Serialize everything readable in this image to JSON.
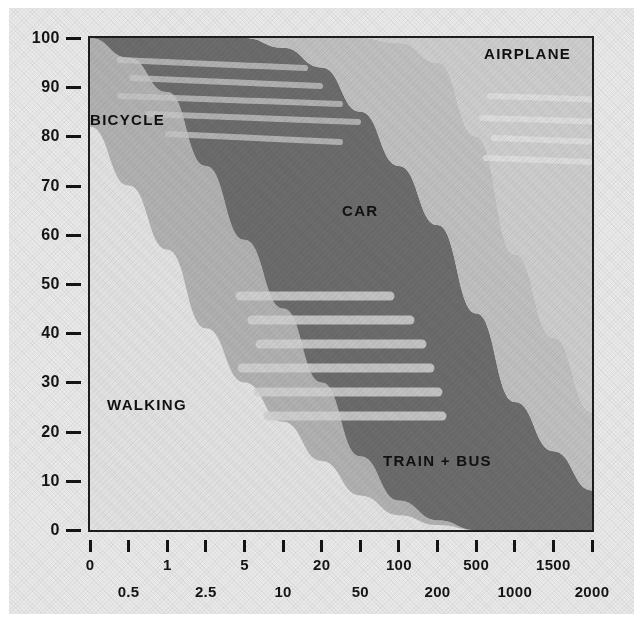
{
  "chart_data": {
    "type": "area",
    "title": "",
    "subtitle": "",
    "xlabel": "",
    "ylabel": "",
    "grid": false,
    "legend_position": "inline-labels",
    "ylim": [
      0,
      100
    ],
    "ytick_labels": [
      "100",
      "90",
      "80",
      "70",
      "60",
      "50",
      "40",
      "30",
      "20",
      "10",
      "0"
    ],
    "ytick_values": [
      100,
      90,
      80,
      70,
      60,
      50,
      40,
      30,
      20,
      10,
      0
    ],
    "xtick_labels_upper": [
      "0",
      "1",
      "5",
      "20",
      "100",
      "500",
      "1500"
    ],
    "xtick_labels_lower": [
      "0.5",
      "2.5",
      "10",
      "50",
      "200",
      "1000",
      "2000"
    ],
    "xtick_labels_interleaved": [
      "0",
      "0.5",
      "1",
      "2.5",
      "5",
      "10",
      "20",
      "50",
      "100",
      "200",
      "500",
      "1000",
      "1500",
      "2000"
    ],
    "xtick_count": 14,
    "x": [
      0,
      0.5,
      1,
      2.5,
      5,
      10,
      20,
      50,
      100,
      200,
      500,
      1000,
      1500,
      2000
    ],
    "series": [
      {
        "name": "WALKING",
        "color": "#e4e4e4",
        "values": [
          82,
          70,
          57,
          41,
          30,
          22,
          14,
          7,
          3,
          1,
          0,
          0,
          0,
          0
        ]
      },
      {
        "name": "BICYCLE",
        "color": "#b3b3b3",
        "values": [
          18,
          26,
          32,
          33,
          29,
          23,
          16,
          8,
          3,
          1,
          0,
          0,
          0,
          0
        ]
      },
      {
        "name": "CAR",
        "color": "#6d6d6d",
        "values": [
          0,
          4,
          11,
          26,
          41,
          53,
          64,
          70,
          68,
          60,
          44,
          26,
          16,
          8
        ]
      },
      {
        "name": "TRAIN + BUS",
        "color": "#c2c2c2",
        "values": [
          0,
          0,
          0,
          0,
          0,
          2,
          6,
          15,
          25,
          33,
          36,
          30,
          23,
          16
        ]
      },
      {
        "name": "AIRPLANE",
        "color": "#cfcfcf",
        "values": [
          0,
          0,
          0,
          0,
          0,
          0,
          0,
          0,
          1,
          5,
          20,
          44,
          61,
          76
        ]
      }
    ],
    "annotations": [
      {
        "text": "BICYCLE",
        "x_px": 90,
        "y_px": 111
      },
      {
        "text": "AIRPLANE",
        "x_px": 484,
        "y_px": 45
      },
      {
        "text": "CAR",
        "x_px": 342,
        "y_px": 202
      },
      {
        "text": "WALKING",
        "x_px": 107,
        "y_px": 396
      },
      {
        "text": "TRAIN + BUS",
        "x_px": 383,
        "y_px": 452
      }
    ]
  },
  "axis": {
    "y_labels": [
      "100",
      "90",
      "80",
      "70",
      "60",
      "50",
      "40",
      "30",
      "20",
      "10",
      "0"
    ],
    "x_row_upper": [
      "0",
      "1",
      "5",
      "20",
      "100",
      "500",
      "1500"
    ],
    "x_row_lower": [
      "0.5",
      "2.5",
      "10",
      "50",
      "200",
      "1000",
      "2000"
    ]
  },
  "colors": {
    "walking": "#e4e4e4",
    "bicycle": "#b3b3b3",
    "car": "#6d6d6d",
    "train_bus": "#c2c2c2",
    "airplane": "#cfcfcf",
    "frame": "#1d1d1d",
    "paper": "#e9e9e9",
    "text": "#141414"
  }
}
